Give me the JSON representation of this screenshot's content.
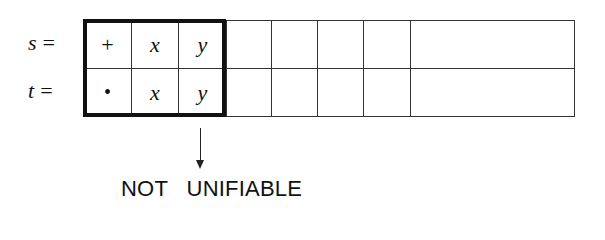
{
  "rows": [
    {
      "label": "s",
      "eq": "=",
      "cells": [
        "+",
        "x",
        "y",
        "",
        "",
        "",
        "",
        ""
      ]
    },
    {
      "label": "t",
      "eq": "=",
      "cells": [
        "•",
        "x",
        "y",
        "",
        "",
        "",
        "",
        ""
      ]
    }
  ],
  "highlighted_columns": 3,
  "result": "NOT   UNIFIABLE",
  "arrow_direction": "down"
}
